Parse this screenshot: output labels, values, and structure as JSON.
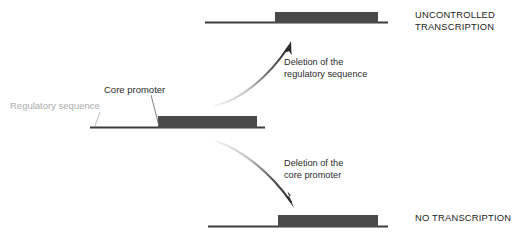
{
  "diagram": {
    "colors": {
      "gene_box": "#4a4a4a",
      "dna_line": "#3d3d3d",
      "arrow": "#2b2b2b",
      "faint_text": "#ababab",
      "dark_text": "#2b2b2b",
      "background": "#ffffff"
    },
    "labels": {
      "core_promoter": "Core promoter",
      "regulatory_sequence": "Regulatory sequence"
    },
    "annotations": {
      "upper": "Deletion of the\nregulatory sequence",
      "lower": "Deletion of the\ncore promoter"
    },
    "outcomes": {
      "upper": "UNCONTROLLED\nTRANSCRIPTION",
      "lower": "NO TRANSCRIPTION"
    },
    "constructs": [
      {
        "id": "intact-gene",
        "position": "center-left",
        "has_regulatory_sequence": true,
        "has_core_promoter": true
      },
      {
        "id": "regulatory-deleted-gene",
        "position": "top-right",
        "has_regulatory_sequence": false,
        "has_core_promoter": true
      },
      {
        "id": "core-promoter-deleted-gene",
        "position": "bottom-right",
        "has_regulatory_sequence": false,
        "has_core_promoter": false
      }
    ]
  }
}
